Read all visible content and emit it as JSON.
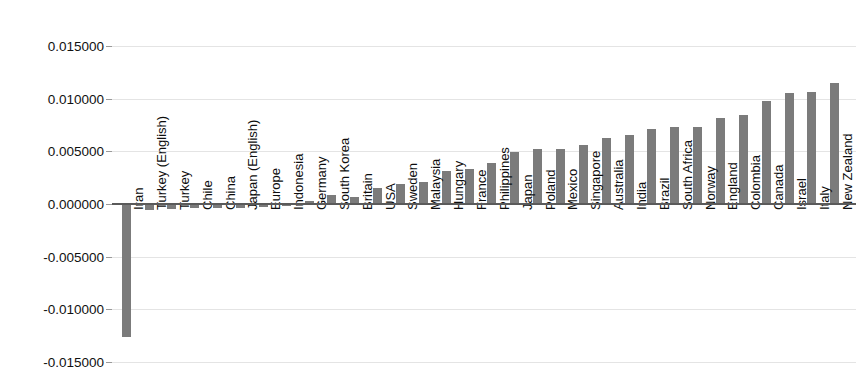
{
  "chart_data": {
    "type": "bar",
    "title": "",
    "subtitle": "",
    "xlabel": "",
    "ylabel": "",
    "orientation": "vertical",
    "grid": true,
    "legend": false,
    "legend_position": "none",
    "bar_color": "#7b7b7b",
    "zero_line_color": "#5a5a5a",
    "gridline_color": "#e4e4e4",
    "ylim": [
      -0.015,
      0.0165
    ],
    "ytick_labels": [
      "0.015000",
      "0.010000",
      "0.005000",
      "0.000000",
      "-0.005000",
      "-0.010000",
      "-0.015000"
    ],
    "ytick_values": [
      0.015,
      0.01,
      0.005,
      0.0,
      -0.005,
      -0.01,
      -0.015
    ],
    "categories": [
      "Iran",
      "Turkey (English)",
      "Turkey",
      "Chile",
      "China",
      "Japan (English)",
      "Europe",
      "Indonesia",
      "Germany",
      "South Korea",
      "Britain",
      "USA",
      "Sweden",
      "Malaysia",
      "Hungary",
      "France",
      "Philippines",
      "Japan",
      "Poland",
      "Mexico",
      "Singapore",
      "Australia",
      "India",
      "Brazil",
      "South Africa",
      "Norway",
      "England",
      "Colombia",
      "Canada",
      "Israel",
      "Italy",
      "New Zealand"
    ],
    "values": [
      -0.01265,
      -0.00055,
      -0.00048,
      -0.00042,
      -0.0004,
      -0.00038,
      -0.0003,
      -0.00022,
      0.00025,
      0.00085,
      0.0007,
      0.00155,
      0.00185,
      0.0021,
      0.0031,
      0.00335,
      0.00385,
      0.0049,
      0.0052,
      0.0052,
      0.0056,
      0.0063,
      0.0065,
      0.00715,
      0.0073,
      0.0073,
      0.00815,
      0.0084,
      0.00975,
      0.0105,
      0.0106,
      0.0115
    ]
  }
}
